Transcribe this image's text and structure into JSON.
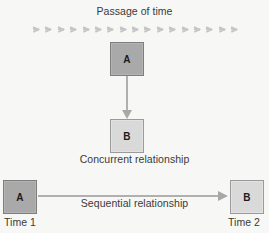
{
  "diagram": {
    "title": "Passage of time",
    "timeline": {
      "icon": "chevron-right-arrow",
      "count": 17,
      "color": "#c6c6c6"
    },
    "concurrent": {
      "source_box": "A",
      "target_box": "B",
      "caption": "Concurrent relationship",
      "connector": "down-arrow"
    },
    "sequential": {
      "source_box": "A",
      "target_box": "B",
      "caption": "Sequential relationship",
      "connector": "right-arrow",
      "start_time_label": "Time 1",
      "end_time_label": "Time 2"
    },
    "colors": {
      "background": "#f7f7f5",
      "box_dark_fill": "#a9a9a9",
      "box_dark_border": "#7e7e7e",
      "box_light_fill": "#d9d9d9",
      "box_light_border": "#9a9a9a",
      "connector": "#b0b0b0",
      "text": "#3a3a3a"
    }
  }
}
